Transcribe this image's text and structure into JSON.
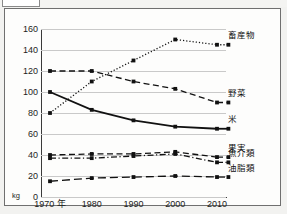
{
  "topstrip": {
    "box_label": "",
    "title_fragment": ""
  },
  "chart_data": {
    "type": "line",
    "title": "",
    "xlabel": "",
    "ylabel": "kg",
    "unit": "kg",
    "x": [
      1970,
      1980,
      1990,
      2000,
      2010
    ],
    "xtick_labels": [
      "1970 年",
      "1980",
      "1990",
      "2000",
      "2010"
    ],
    "ylim": [
      0,
      160
    ],
    "ytick_labels": [
      "0",
      "20",
      "40",
      "60",
      "80",
      "100",
      "120",
      "140",
      "160"
    ],
    "yticks": [
      0,
      20,
      40,
      60,
      80,
      100,
      120,
      140,
      160
    ],
    "grid": true,
    "legend_position": "right",
    "series": [
      {
        "name": "畜産物",
        "style": "dotted",
        "color": "#111111",
        "values": [
          80,
          110,
          130,
          150,
          145
        ]
      },
      {
        "name": "野菜",
        "style": "dashed",
        "color": "#111111",
        "values": [
          120,
          120,
          110,
          103,
          90
        ]
      },
      {
        "name": "米",
        "style": "solid",
        "color": "#111111",
        "values": [
          100,
          83,
          73,
          67,
          65
        ]
      },
      {
        "name": "果実",
        "style": "dashed",
        "color": "#111111",
        "values": [
          40,
          41,
          41,
          43,
          38
        ]
      },
      {
        "name": "魚介類",
        "style": "dashdot",
        "color": "#111111",
        "values": [
          37,
          37,
          39,
          41,
          33
        ]
      },
      {
        "name": "油脂類",
        "style": "longdash",
        "color": "#111111",
        "values": [
          15,
          18,
          19,
          20,
          19
        ]
      }
    ]
  }
}
